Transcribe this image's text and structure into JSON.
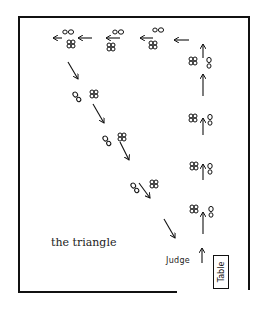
{
  "diagram": {
    "title": "the triangle",
    "labels": {
      "judge": "Judge",
      "table": "Table"
    },
    "colors": {
      "ink": "#111111",
      "background": "#ffffff"
    },
    "legs": [
      {
        "name": "up-right-side",
        "direction": "up"
      },
      {
        "name": "across-top",
        "direction": "left"
      },
      {
        "name": "diagonal-back",
        "direction": "down-right"
      }
    ]
  }
}
